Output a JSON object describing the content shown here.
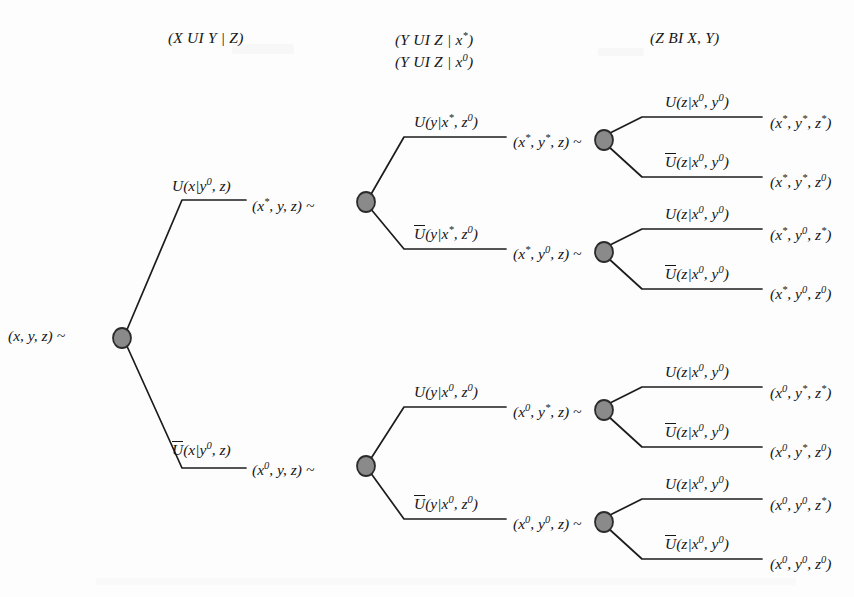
{
  "figure": {
    "type": "binary-decision-tree"
  },
  "headers": [
    {
      "id": "h1",
      "text": "(X UI Y | Z)",
      "x": 168,
      "y": 30
    },
    {
      "id": "h2a",
      "text": "(Y UI Z | x*)",
      "x": 395,
      "y": 30
    },
    {
      "id": "h2b",
      "text": "(Y UI Z | x0)",
      "x": 395,
      "y": 52
    },
    {
      "id": "h3",
      "text": "(Z BI X, Y)",
      "x": 650,
      "y": 30
    }
  ],
  "root": {
    "label": "(x, y, z) ~",
    "label_x": 8,
    "label_y": 328,
    "node_x": 122,
    "node_y": 338
  },
  "level1": {
    "branches": [
      {
        "id": "l1-upper",
        "branch_label": "U(x|y0, z)",
        "branch_label_x": 172,
        "branch_label_y": 176,
        "overline": false,
        "state": "(x*, y, z) ~",
        "state_x": 252,
        "state_y": 196,
        "node_x": 366,
        "node_y": 202
      },
      {
        "id": "l1-lower",
        "branch_label": "U(x|y0, z)",
        "branch_label_x": 172,
        "branch_label_y": 440,
        "overline": true,
        "state": "(x0, y, z) ~",
        "state_x": 252,
        "state_y": 460,
        "node_x": 366,
        "node_y": 466
      }
    ]
  },
  "level2": {
    "branches": [
      {
        "id": "l2-a",
        "branch_label": "U(y|x*, z0)",
        "branch_label_x": 414,
        "branch_label_y": 112,
        "overline": false,
        "state": "(x*, y*, z) ~",
        "state_x": 513,
        "state_y": 132,
        "node_x": 604,
        "node_y": 140
      },
      {
        "id": "l2-b",
        "branch_label": "U(y|x*, z0)",
        "branch_label_x": 414,
        "branch_label_y": 224,
        "overline": true,
        "state": "(x*, y0, z) ~",
        "state_x": 513,
        "state_y": 244,
        "node_x": 604,
        "node_y": 252
      },
      {
        "id": "l2-c",
        "branch_label": "U(y|x0, z0)",
        "branch_label_x": 414,
        "branch_label_y": 382,
        "overline": false,
        "state": "(x0, y*, z) ~",
        "state_x": 513,
        "state_y": 402,
        "node_x": 604,
        "node_y": 410
      },
      {
        "id": "l2-d",
        "branch_label": "U(y|x0, z0)",
        "branch_label_x": 414,
        "branch_label_y": 494,
        "overline": true,
        "state": "(x0, y0, z) ~",
        "state_x": 513,
        "state_y": 514,
        "node_x": 604,
        "node_y": 522
      }
    ]
  },
  "level3": {
    "branch_label_positive": "U(z|x0, y0)",
    "branch_label_negative": "U(z|x0, y0)",
    "branches": [
      {
        "id": "l3-1",
        "branch_label": "U(z|x0, y0)",
        "branch_label_x": 665,
        "branch_label_y": 92,
        "overline": false,
        "leaf": "(x*, y*, z*)",
        "leaf_x": 770,
        "leaf_y": 113
      },
      {
        "id": "l3-2",
        "branch_label": "U(z|x0, y0)",
        "branch_label_x": 665,
        "branch_label_y": 152,
        "overline": true,
        "leaf": "(x*, y*, z0)",
        "leaf_x": 770,
        "leaf_y": 172
      },
      {
        "id": "l3-3",
        "branch_label": "U(z|x0, y0)",
        "branch_label_x": 665,
        "branch_label_y": 204,
        "overline": false,
        "leaf": "(x*, y0, z*)",
        "leaf_x": 770,
        "leaf_y": 225
      },
      {
        "id": "l3-4",
        "branch_label": "U(z|x0, y0)",
        "branch_label_x": 665,
        "branch_label_y": 264,
        "overline": true,
        "leaf": "(x*, y0, z0)",
        "leaf_x": 770,
        "leaf_y": 284
      },
      {
        "id": "l3-5",
        "branch_label": "U(z|x0, y0)",
        "branch_label_x": 665,
        "branch_label_y": 362,
        "overline": false,
        "leaf": "(x0, y*, z*)",
        "leaf_x": 770,
        "leaf_y": 383
      },
      {
        "id": "l3-6",
        "branch_label": "U(z|x0, y0)",
        "branch_label_x": 665,
        "branch_label_y": 422,
        "overline": true,
        "leaf": "(x0, y*, z0)",
        "leaf_x": 770,
        "leaf_y": 442
      },
      {
        "id": "l3-7",
        "branch_label": "U(z|x0, y0)",
        "branch_label_x": 665,
        "branch_label_y": 474,
        "overline": false,
        "leaf": "(x0, y0, z*)",
        "leaf_x": 770,
        "leaf_y": 495
      },
      {
        "id": "l3-8",
        "branch_label": "U(z|x0, y0)",
        "branch_label_x": 665,
        "branch_label_y": 534,
        "overline": true,
        "leaf": "(x0, y0, z0)",
        "leaf_x": 770,
        "leaf_y": 554
      }
    ]
  },
  "style": {
    "node_fill": "#8a8a8a",
    "node_stroke": "#2b2b2b",
    "edge_color": "#1c1c1c",
    "text_color": "#161616",
    "background": "#fdfdfd"
  }
}
